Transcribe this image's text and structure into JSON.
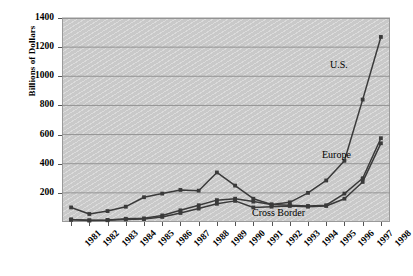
{
  "chart_data": {
    "type": "line",
    "title": "",
    "xlabel": "",
    "ylabel": "Billions of Dollars",
    "ylim": [
      0,
      1400
    ],
    "ytick_step": 200,
    "yticks": [
      1400,
      1200,
      1000,
      800,
      600,
      400,
      200,
      0
    ],
    "grid": true,
    "legend_position": "inline-annotations",
    "categories": [
      "1981",
      "1982",
      "1983",
      "1984",
      "1985",
      "1986",
      "1987",
      "1988",
      "1989",
      "1990",
      "1991",
      "1992",
      "1993",
      "1994",
      "1995",
      "1996",
      "1997",
      "1998"
    ],
    "series": [
      {
        "name": "U.S.",
        "color": "#3a3a3a",
        "marker": "square",
        "values": [
          100,
          55,
          75,
          105,
          170,
          195,
          220,
          215,
          340,
          250,
          160,
          120,
          135,
          200,
          285,
          420,
          840,
          1270
        ]
      },
      {
        "name": "Europe",
        "color": "#3a3a3a",
        "marker": "square",
        "values": [
          15,
          12,
          14,
          22,
          25,
          45,
          80,
          115,
          150,
          160,
          140,
          120,
          115,
          110,
          115,
          195,
          300,
          575
        ]
      },
      {
        "name": "Cross Border",
        "color": "#3a3a3a",
        "marker": "square",
        "values": [
          18,
          10,
          12,
          18,
          20,
          35,
          62,
          92,
          125,
          145,
          100,
          105,
          110,
          105,
          110,
          160,
          275,
          540
        ]
      }
    ],
    "annotations": [
      {
        "text": "U.S.",
        "series": "U.S."
      },
      {
        "text": "Europe",
        "series": "Europe"
      },
      {
        "text": "Cross Border",
        "series": "Cross Border"
      }
    ]
  },
  "axis": {
    "y_title": "Billions of Dollars"
  }
}
